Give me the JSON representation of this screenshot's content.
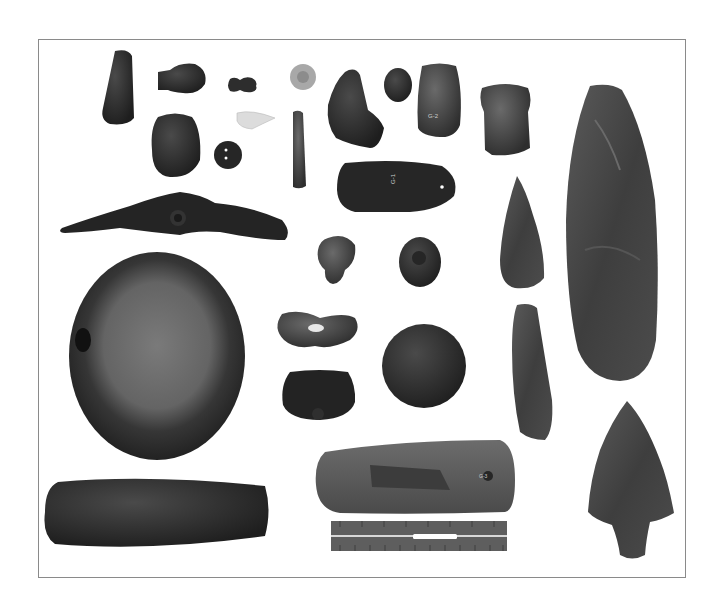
{
  "image": {
    "description": "Black-and-white photograph of prehistoric stone artifacts arranged on a white background inside a thin rectangular frame, with a measuring ruler at bottom center",
    "background_color": "#ffffff",
    "frame_color": "#8a8a8a"
  },
  "artifacts": [
    {
      "id": "small-celt",
      "label": ""
    },
    {
      "id": "pipe-bowl",
      "label": ""
    },
    {
      "id": "bead-effigy",
      "label": ""
    },
    {
      "id": "light-disc",
      "label": ""
    },
    {
      "id": "triangular-stone",
      "label": ""
    },
    {
      "id": "oval-pebble",
      "label": ""
    },
    {
      "id": "adze-left",
      "label": "G-2"
    },
    {
      "id": "squared-adze",
      "label": ""
    },
    {
      "id": "grooved-stone",
      "label": ""
    },
    {
      "id": "perforated-button",
      "label": ""
    },
    {
      "id": "white-point",
      "label": ""
    },
    {
      "id": "stone-rod",
      "label": ""
    },
    {
      "id": "gorget",
      "label": "G-1"
    },
    {
      "id": "bannerstone",
      "label": ""
    },
    {
      "id": "knobbed-stone-a",
      "label": ""
    },
    {
      "id": "pitted-stone",
      "label": ""
    },
    {
      "id": "lanceolate-point",
      "label": ""
    },
    {
      "id": "large-biface",
      "label": ""
    },
    {
      "id": "mortar-stone",
      "label": ""
    },
    {
      "id": "boatstone",
      "label": ""
    },
    {
      "id": "grooved-block",
      "label": ""
    },
    {
      "id": "discoidal",
      "label": ""
    },
    {
      "id": "blade",
      "label": ""
    },
    {
      "id": "notched-point",
      "label": ""
    },
    {
      "id": "large-celt",
      "label": "G-3"
    },
    {
      "id": "pestle-bar",
      "label": ""
    }
  ],
  "ruler": {
    "top_numbers": [
      "1",
      "2",
      "3",
      "4",
      "5",
      "6",
      "7",
      "8"
    ],
    "bottom_numbers": [
      "20",
      "19",
      "18",
      "17",
      "16",
      "15",
      "14",
      "13",
      "12",
      "11",
      "10",
      "9"
    ]
  }
}
